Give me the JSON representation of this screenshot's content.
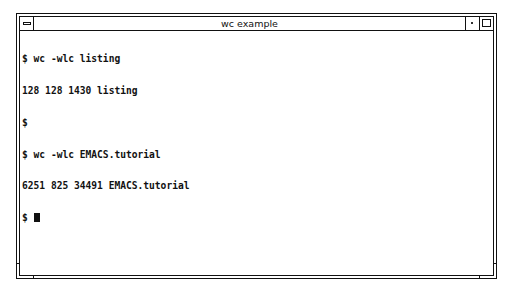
{
  "window": {
    "title": "wc example",
    "menu_button": "window-menu",
    "minimize_button": "minimize",
    "maximize_button": "maximize"
  },
  "terminal": {
    "lines": [
      "$ wc -wlc listing",
      "128 128 1430 listing",
      "$",
      "$ wc -wlc EMACS.tutorial",
      "6251 825 34491 EMACS.tutorial"
    ],
    "prompt": "$ ",
    "cursor": "block"
  }
}
